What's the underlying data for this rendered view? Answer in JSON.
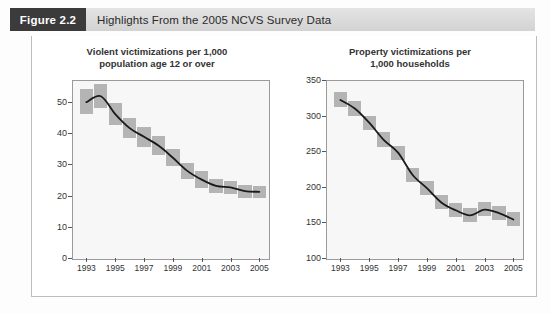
{
  "header": {
    "figure_tag": "Figure 2.2",
    "title": "Highlights From the 2005 NCVS Survey Data"
  },
  "chart_data": [
    {
      "id": "violent",
      "type": "line",
      "title": "Violent victimizations per 1,000 population age 12 or over",
      "title_line1": "Violent victimizations per 1,000",
      "title_line2": "population age 12 or over",
      "xlabel": "",
      "ylabel": "",
      "grid": false,
      "legend": "none",
      "xlim": [
        1992,
        2005.6
      ],
      "ylim": [
        0,
        57
      ],
      "yticks": [
        0,
        10,
        20,
        30,
        40,
        50
      ],
      "ytick_labels": [
        "0",
        "10",
        "20",
        "30",
        "40",
        "50"
      ],
      "xticks": [
        1993,
        1995,
        1997,
        1999,
        2001,
        2003,
        2005
      ],
      "xtick_labels": [
        "1993",
        "1995",
        "1997",
        "1999",
        "2001",
        "2003",
        "2005"
      ],
      "x": [
        1993,
        1994,
        1995,
        1996,
        1997,
        1998,
        1999,
        2000,
        2001,
        2002,
        2003,
        2004,
        2005
      ],
      "values": [
        49.9,
        51.8,
        46.1,
        41.6,
        38.8,
        36.0,
        32.1,
        27.9,
        25.1,
        23.1,
        22.6,
        21.4,
        21.2
      ],
      "ci_low": [
        46.0,
        48.0,
        42.5,
        38.5,
        35.5,
        33.0,
        29.3,
        25.3,
        22.5,
        20.8,
        20.4,
        19.3,
        19.2
      ],
      "ci_high": [
        54.0,
        55.6,
        49.7,
        44.7,
        42.1,
        39.0,
        34.9,
        30.5,
        27.7,
        25.4,
        24.8,
        23.5,
        23.2
      ]
    },
    {
      "id": "property",
      "type": "line",
      "title": "Property victimizations per 1,000 households",
      "title_line1": "Property victimizations per",
      "title_line2": "1,000 households",
      "xlabel": "",
      "ylabel": "",
      "grid": false,
      "legend": "none",
      "xlim": [
        1992,
        2005.6
      ],
      "ylim": [
        100,
        350
      ],
      "yticks": [
        100,
        150,
        200,
        250,
        300,
        350
      ],
      "ytick_labels": [
        "100",
        "150",
        "200",
        "250",
        "300",
        "350"
      ],
      "xticks": [
        1993,
        1995,
        1997,
        1999,
        2001,
        2003,
        2005
      ],
      "xtick_labels": [
        "1993",
        "1995",
        "1997",
        "1999",
        "2001",
        "2003",
        "2005"
      ],
      "x": [
        1993,
        1994,
        1995,
        1996,
        1997,
        1998,
        1999,
        2000,
        2001,
        2002,
        2003,
        2004,
        2005
      ],
      "values": [
        322,
        310,
        290,
        266,
        248,
        217,
        198,
        178,
        167,
        160,
        168,
        163,
        154
      ],
      "ci_low": [
        312,
        299,
        280,
        256,
        238,
        207,
        188,
        169,
        158,
        151,
        159,
        154,
        145
      ],
      "ci_high": [
        333,
        321,
        300,
        277,
        258,
        227,
        208,
        188,
        177,
        170,
        178,
        173,
        164
      ]
    }
  ]
}
